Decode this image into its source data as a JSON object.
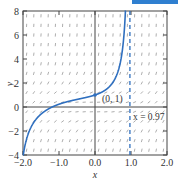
{
  "chart_data": {
    "type": "line",
    "title": "",
    "xlabel": "x",
    "ylabel": "y",
    "xlim": [
      -2.0,
      2.0
    ],
    "ylim": [
      -4,
      8
    ],
    "x_ticks": [
      "-2.0",
      "-1.0",
      "0.0",
      "1.0",
      "2.0"
    ],
    "y_ticks": [
      "-4",
      "-2",
      "0",
      "2",
      "4",
      "6",
      "8"
    ],
    "grid": false,
    "background": "slope field (direction field) of dy/dx = x^2 + y^2",
    "series": [
      {
        "name": "solution curve through (0, 1)",
        "color": "#2f6fbf",
        "x": [
          -2.0,
          -1.9,
          -1.8,
          -1.6,
          -1.4,
          -1.2,
          -1.0,
          -0.8,
          -0.6,
          -0.4,
          -0.2,
          0.0,
          0.2,
          0.4,
          0.6,
          0.7,
          0.8,
          0.9,
          0.95
        ],
        "y": [
          -4.0,
          -2.3,
          -1.5,
          -0.8,
          -0.4,
          -0.05,
          0.15,
          0.35,
          0.5,
          0.65,
          0.8,
          1.0,
          1.25,
          1.65,
          2.5,
          3.3,
          4.8,
          8.0,
          8.0
        ]
      }
    ],
    "annotations": [
      {
        "text": "(0, 1)",
        "x": 0.0,
        "y": 1.0,
        "type": "point"
      },
      {
        "text": "x = 0.97",
        "x": 0.97,
        "type": "vertical-asymptote",
        "style": "dashed",
        "color": "#2f6fbf"
      }
    ]
  },
  "labels": {
    "xlabel": "x",
    "ylabel": "y",
    "point_label": "(0, 1)",
    "asymptote_label": "x = 0.97"
  }
}
